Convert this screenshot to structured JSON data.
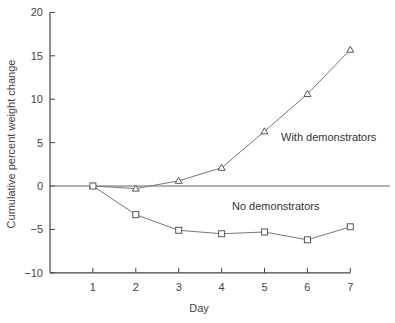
{
  "chart_data": {
    "type": "line",
    "title": "",
    "xlabel": "Day",
    "ylabel": "Cumulative percent weight change",
    "x": [
      1,
      2,
      3,
      4,
      5,
      6,
      7
    ],
    "xlim": [
      0,
      7
    ],
    "ylim": [
      -10,
      20
    ],
    "yticks": [
      -10,
      -5,
      0,
      5,
      10,
      15,
      20
    ],
    "xticks": [
      1,
      2,
      3,
      4,
      5,
      6,
      7
    ],
    "grid": false,
    "reference_line": {
      "y": 0
    },
    "series": [
      {
        "name": "With demonstrators",
        "marker": "triangle",
        "values": [
          0,
          -0.3,
          0.6,
          2.1,
          6.3,
          10.6,
          15.7
        ]
      },
      {
        "name": "No demonstrators",
        "marker": "square",
        "values": [
          0,
          -3.3,
          -5.1,
          -5.5,
          -5.3,
          -6.2,
          -4.7
        ]
      }
    ],
    "annotations": [
      {
        "text": "With demonstrators",
        "x": 5.4,
        "y": 5.6
      },
      {
        "text": "No demonstrators",
        "x": 4.2,
        "y": -2.3
      }
    ]
  },
  "labels": {
    "xlabel": "Day",
    "ylabel": "Cumulative percent weight change",
    "with": "With demonstrators",
    "without": "No demonstrators"
  }
}
